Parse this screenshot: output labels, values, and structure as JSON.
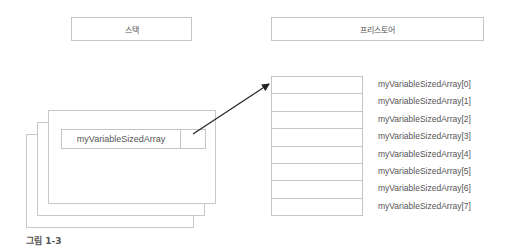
{
  "stack": {
    "label": "스택"
  },
  "freestore": {
    "label": "프리스토어"
  },
  "variable": {
    "name": "myVariableSizedArray"
  },
  "array": {
    "length": 8,
    "labels": [
      "myVariableSizedArray[0]",
      "myVariableSizedArray[1]",
      "myVariableSizedArray[2]",
      "myVariableSizedArray[3]",
      "myVariableSizedArray[4]",
      "myVariableSizedArray[5]",
      "myVariableSizedArray[6]",
      "myVariableSizedArray[7]"
    ]
  },
  "caption": "그림 1-3",
  "colors": {
    "border": "#c4c4c4",
    "text": "#555555",
    "arrow": "#222222"
  }
}
